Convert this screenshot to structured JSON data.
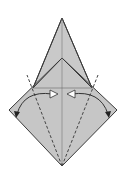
{
  "diagram": {
    "type": "origami-fold-step",
    "colors": {
      "paper": "#c8c8c8",
      "paper_light": "#d4d4d4",
      "outline": "#3a3a3a",
      "fold_line": "#555555",
      "marker_fill": "#ffffff",
      "background": "#ffffff"
    },
    "points": {
      "top_tip": [
        62,
        18
      ],
      "inner_peak": [
        62,
        58
      ],
      "left_shoulder": [
        33,
        88
      ],
      "right_shoulder": [
        92,
        88
      ],
      "left_corner": [
        9,
        110
      ],
      "right_corner": [
        117,
        110
      ],
      "bottom": [
        62,
        166
      ]
    },
    "fold_lines": [
      {
        "type": "valley-dashed",
        "from": [
          62,
          166
        ],
        "to": [
          27,
          75
        ]
      },
      {
        "type": "valley-dashed",
        "from": [
          62,
          166
        ],
        "to": [
          98,
          75
        ]
      }
    ],
    "arrows": [
      {
        "direction": "left",
        "from": [
          36,
          93
        ],
        "to": [
          16,
          115
        ]
      },
      {
        "direction": "right",
        "from": [
          89,
          93
        ],
        "to": [
          110,
          115
        ]
      }
    ],
    "markers": [
      {
        "shape": "triangle-right",
        "at": [
          55,
          94
        ]
      },
      {
        "shape": "triangle-left",
        "at": [
          69,
          94
        ]
      }
    ]
  }
}
